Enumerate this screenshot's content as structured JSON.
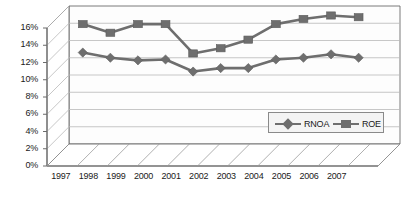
{
  "chart_data": {
    "type": "line",
    "title": "",
    "subtitle": "",
    "xlabel": "",
    "ylabel": "",
    "categories": [
      "1997",
      "1998",
      "1999",
      "2000",
      "2001",
      "2002",
      "2003",
      "2004",
      "2005",
      "2006",
      "2007"
    ],
    "series": [
      {
        "name": "RNOA",
        "marker": "diamond",
        "color": "#6e6e6e",
        "values": [
          10.6,
          10.0,
          9.7,
          9.8,
          8.4,
          8.8,
          8.8,
          9.8,
          10.0,
          10.4,
          10.0
        ]
      },
      {
        "name": "ROE",
        "marker": "square",
        "color": "#6e6e6e",
        "values": [
          13.9,
          12.9,
          13.9,
          13.9,
          10.5,
          11.1,
          12.1,
          13.9,
          14.5,
          14.9,
          14.7
        ]
      }
    ],
    "ylim": [
      0,
      16
    ],
    "ytick_values": [
      0,
      2,
      4,
      6,
      8,
      10,
      12,
      14,
      16
    ],
    "ytick_labels": [
      "0%",
      "2%",
      "4%",
      "6%",
      "8%",
      "10%",
      "12%",
      "14%",
      "16%"
    ],
    "grid": true,
    "legend_position": "lower-right",
    "style": "3d-perspective",
    "plot_background": "#fcfcfc",
    "grid_color": "#b8b8b8",
    "axis_color": "#6b6b6b"
  },
  "legend": {
    "items": [
      {
        "label": "RNOA"
      },
      {
        "label": "ROE"
      }
    ]
  }
}
